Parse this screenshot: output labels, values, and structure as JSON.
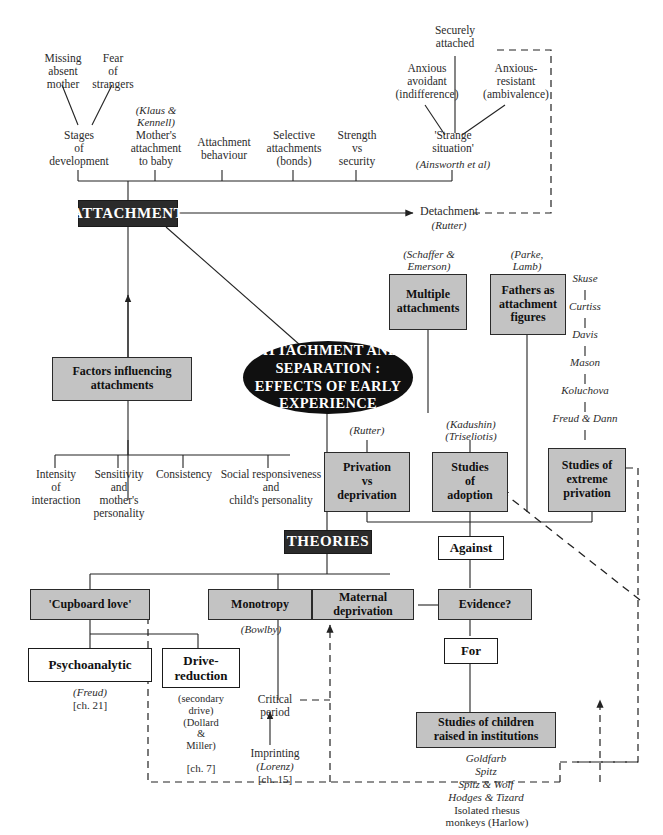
{
  "diagram": {
    "title": "Attachment and separation : effects of early experience",
    "central_node": "ATTACHMENT AND\nSEPARATION :\nEFFECTS OF EARLY\nEXPERIENCE",
    "section_headings": {
      "attachment": "ATTACHMENT",
      "theories": "THEORIES"
    }
  },
  "top_cues": {
    "missing_mother": "Missing\nabsent\nmother",
    "fear_strangers": "Fear\nof\nstrangers",
    "securely_attached": "Securely\nattached",
    "anxious_avoidant": "Anxious\navoidant\n(indifference)",
    "anxious_resistant": "Anxious-\nresistant\n(ambivalence)"
  },
  "attachment_topics": [
    {
      "label": "Stages\nof\ndevelopment",
      "cite": ""
    },
    {
      "label": "Mother's\nattachment\nto baby",
      "cite": "(Klaus &\nKennell)"
    },
    {
      "label": "Attachment\nbehaviour",
      "cite": ""
    },
    {
      "label": "Selective\nattachments\n(bonds)",
      "cite": ""
    },
    {
      "label": "Strength\nvs\nsecurity",
      "cite": ""
    },
    {
      "label": "'Strange\nsituation'",
      "cite": "(Ainsworth et al)"
    }
  ],
  "detachment": {
    "label": "Detachment",
    "cite": "(Rutter)"
  },
  "factors": {
    "box": "Factors influencing\nattachments",
    "items": [
      "Intensity\nof\ninteraction",
      "Sensitivity\nand\nmother's\npersonality",
      "Consistency",
      "Social responsiveness\nand\nchild's personality"
    ]
  },
  "separation_branches": [
    {
      "label": "Multiple\nattachments",
      "cite": "(Schaffer &\nEmerson)"
    },
    {
      "label": "Fathers as\nattachment\nfigures",
      "cite": "(Parke,\nLamb)"
    }
  ],
  "study_boxes": [
    {
      "label": "Privation\nvs\ndeprivation",
      "cite": "(Rutter)"
    },
    {
      "label": "Studies\nof\nadoption",
      "cite": "(Kadushin)\n(Triseliotis)"
    },
    {
      "label": "Studies of\nextreme\nprivation",
      "cite": ""
    }
  ],
  "privation_chain": [
    "Skuse",
    "Curtiss",
    "Davis",
    "Mason",
    "Koluchova",
    "Freud & Dann"
  ],
  "theories": {
    "cupboard_love": "'Cupboard love'",
    "psychoanalytic": {
      "label": "Psychoanalytic",
      "cite": "(Freud)",
      "chapter": "[ch. 21]"
    },
    "drive_reduction": {
      "label": "Drive-\nreduction",
      "cite": "(secondary\ndrive)\n(Dollard\n&\nMiller)",
      "chapter": "[ch. 7]"
    },
    "monotropy": "Monotropy",
    "maternal_deprivation": "Maternal\ndeprivation",
    "bowlby_cite": "(Bowlby)",
    "critical_period": "Critical\nperiod",
    "imprinting": {
      "label": "Imprinting",
      "cite": "(Lorenz)",
      "chapter": "[ch. 15]"
    }
  },
  "evidence": {
    "against": "Against",
    "question": "Evidence?",
    "for": "For",
    "institutions_box": "Studies of children\nraised in institutions",
    "institution_studies": [
      "Goldfarb",
      "Spitz",
      "Spitz & Wolf",
      "Hodges & Tizard"
    ],
    "rhesus": "Isolated rhesus\nmonkeys (Harlow)"
  },
  "colors": {
    "grey_box": "#c3c3c3",
    "dark_box": "#2b2b2b",
    "ellipse": "#101010",
    "line": "#222222",
    "background": "#ffffff"
  }
}
